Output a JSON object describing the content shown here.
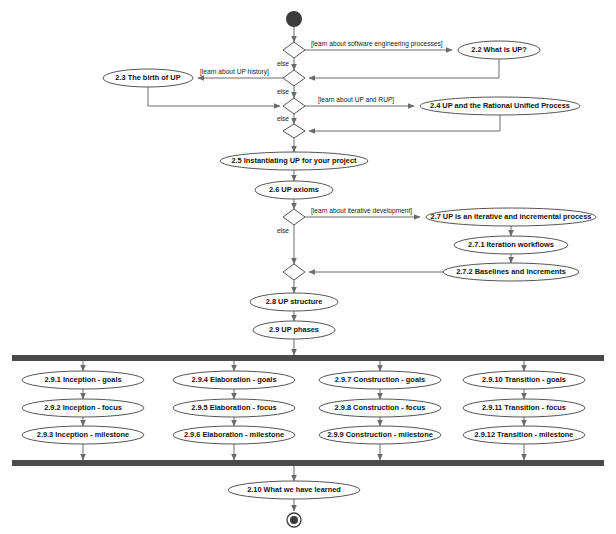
{
  "diagram": {
    "type": "uml-activity-diagram",
    "background_color": "#ffffff",
    "line_color": "#6b6b6b",
    "node_fill": "#ffffff",
    "node_stroke": "#555555",
    "bar_color": "#4a4a4a",
    "initial_node_color": "#3b3b3b",
    "nodes": {
      "initial": "initial-node",
      "final": "final-node"
    },
    "activities": [
      {
        "id": "a22",
        "label": "2.2 What is UP?",
        "cx": 499,
        "cy": 50,
        "rx": 41,
        "ry": 9
      },
      {
        "id": "a23",
        "label": "2.3 The birth of UP",
        "cx": 148,
        "cy": 78,
        "rx": 45,
        "ry": 9
      },
      {
        "id": "a24",
        "label": "2.4 UP and the Rational Unified Process",
        "cx": 500,
        "cy": 106,
        "rx": 80,
        "ry": 9
      },
      {
        "id": "a25",
        "label": "2.5 Instantiating UP for your project",
        "cx": 294,
        "cy": 161,
        "rx": 74,
        "ry": 9
      },
      {
        "id": "a26",
        "label": "2.6 UP axioms",
        "cx": 294,
        "cy": 190,
        "rx": 39,
        "ry": 9
      },
      {
        "id": "a27",
        "label": "2.7 UP is an iterative and incremental process",
        "cx": 511,
        "cy": 217,
        "rx": 85,
        "ry": 9
      },
      {
        "id": "a271",
        "label": "2.7.1 Iteration workflows",
        "cx": 511,
        "cy": 245,
        "rx": 57,
        "ry": 9
      },
      {
        "id": "a272",
        "label": "2.7.2 Baselines and increments",
        "cx": 511,
        "cy": 272,
        "rx": 68,
        "ry": 9
      },
      {
        "id": "a28",
        "label": "2.8 UP structure",
        "cx": 294,
        "cy": 302,
        "rx": 44,
        "ry": 9
      },
      {
        "id": "a29",
        "label": "2.9 UP phases",
        "cx": 294,
        "cy": 330,
        "rx": 41,
        "ry": 9
      },
      {
        "id": "a291",
        "label": "2.9.1 Inception - goals",
        "cx": 83,
        "cy": 380,
        "rx": 61,
        "ry": 9
      },
      {
        "id": "a292",
        "label": "2.9.2 Inception - focus",
        "cx": 83,
        "cy": 408,
        "rx": 61,
        "ry": 9
      },
      {
        "id": "a293",
        "label": "2.9.3 Inception - milestone",
        "cx": 83,
        "cy": 435,
        "rx": 61,
        "ry": 9
      },
      {
        "id": "a294",
        "label": "2.9.4 Elaboration - goals",
        "cx": 234,
        "cy": 380,
        "rx": 61,
        "ry": 9
      },
      {
        "id": "a295",
        "label": "2.9.5 Elaboration - focus",
        "cx": 234,
        "cy": 408,
        "rx": 61,
        "ry": 9
      },
      {
        "id": "a296",
        "label": "2.9.6 Elaboration - milestone",
        "cx": 234,
        "cy": 435,
        "rx": 61,
        "ry": 9
      },
      {
        "id": "a297",
        "label": "2.9.7 Construction - goals",
        "cx": 380,
        "cy": 380,
        "rx": 61,
        "ry": 9
      },
      {
        "id": "a298",
        "label": "2.9.8 Construction - focus",
        "cx": 380,
        "cy": 408,
        "rx": 61,
        "ry": 9
      },
      {
        "id": "a299",
        "label": "2.9.9 Construction - milestone",
        "cx": 380,
        "cy": 435,
        "rx": 61,
        "ry": 9
      },
      {
        "id": "a2910",
        "label": "2.9.10 Transition - goals",
        "cx": 524,
        "cy": 380,
        "rx": 61,
        "ry": 9
      },
      {
        "id": "a2911",
        "label": "2.9.11 Transition - focus",
        "cx": 524,
        "cy": 408,
        "rx": 61,
        "ry": 9
      },
      {
        "id": "a2912",
        "label": "2.9.12 Transition - milestone",
        "cx": 524,
        "cy": 435,
        "rx": 61,
        "ry": 9
      },
      {
        "id": "a210",
        "label": "2.10 What we have learned",
        "cx": 294,
        "cy": 490,
        "rx": 66,
        "ry": 9
      }
    ],
    "decisions": [
      {
        "id": "d1",
        "cx": 294,
        "cy": 50
      },
      {
        "id": "d2",
        "cx": 294,
        "cy": 78
      },
      {
        "id": "d3",
        "cx": 294,
        "cy": 106
      },
      {
        "id": "d4",
        "cx": 294,
        "cy": 131
      },
      {
        "id": "d5",
        "cx": 294,
        "cy": 217
      },
      {
        "id": "d6",
        "cx": 294,
        "cy": 272
      }
    ],
    "guards": [
      {
        "id": "g1",
        "text": "[learn about software engineering processes]",
        "x": 311,
        "y": 44
      },
      {
        "id": "g2",
        "text": "[learn about UP history]",
        "x": 200,
        "y": 72
      },
      {
        "id": "g3",
        "text": "[learn about UP and RUP]",
        "x": 318,
        "y": 100
      },
      {
        "id": "g4",
        "text": "[learn about iterative development]",
        "x": 311,
        "y": 211
      }
    ],
    "else_labels": [
      {
        "id": "e1",
        "text": "else",
        "x": 283,
        "y": 64
      },
      {
        "id": "e2",
        "text": "else",
        "x": 283,
        "y": 92
      },
      {
        "id": "e3",
        "text": "else",
        "x": 283,
        "y": 119
      },
      {
        "id": "e4",
        "text": "else",
        "x": 283,
        "y": 231
      }
    ],
    "bars": [
      {
        "id": "fork-bar",
        "x": 12,
        "y": 355,
        "width": 592,
        "height": 6
      },
      {
        "id": "join-bar",
        "x": 12,
        "y": 460,
        "width": 592,
        "height": 6
      }
    ],
    "initial_node": {
      "cx": 294,
      "cy": 19,
      "r": 8
    },
    "final_node": {
      "cx": 294,
      "cy": 520,
      "r_outer": 7,
      "r_inner": 4
    }
  }
}
